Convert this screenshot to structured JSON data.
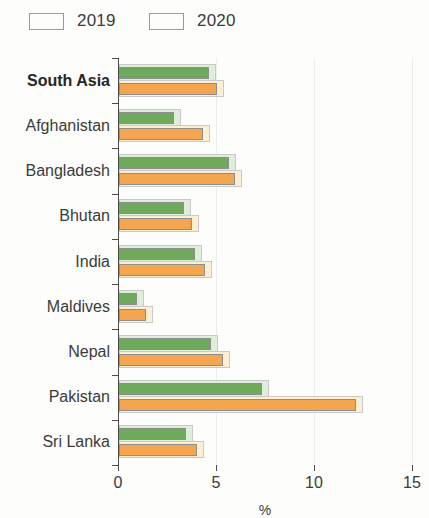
{
  "legend": {
    "items": [
      {
        "label": "2019",
        "color": "#6fa95b",
        "icon": "legend-swatch-green"
      },
      {
        "label": "2020",
        "color": "#f3a54f",
        "icon": "legend-swatch-orange"
      }
    ]
  },
  "axis": {
    "x_ticks": [
      "0",
      "5",
      "10",
      "15"
    ],
    "x_title": "%"
  },
  "chart_data": {
    "type": "bar",
    "orientation": "horizontal",
    "title": "",
    "subtitle": "",
    "xlabel": "%",
    "ylabel": "",
    "xlim": [
      0,
      15
    ],
    "xticks": [
      0,
      5,
      10,
      15
    ],
    "grid": true,
    "legend_position": "top-left",
    "categories": [
      "South Asia",
      "Afghanistan",
      "Bangladesh",
      "Bhutan",
      "India",
      "Maldives",
      "Nepal",
      "Pakistan",
      "Sri Lanka"
    ],
    "highlighted_category": "South Asia",
    "series": [
      {
        "name": "2019",
        "color": "#6fa95b",
        "values": [
          4.6,
          2.8,
          5.6,
          3.3,
          3.9,
          0.9,
          4.7,
          7.3,
          3.4
        ]
      },
      {
        "name": "2020",
        "color": "#f3a54f",
        "values": [
          5.0,
          4.3,
          5.9,
          3.7,
          4.4,
          1.4,
          5.3,
          12.1,
          4.0
        ]
      }
    ]
  }
}
